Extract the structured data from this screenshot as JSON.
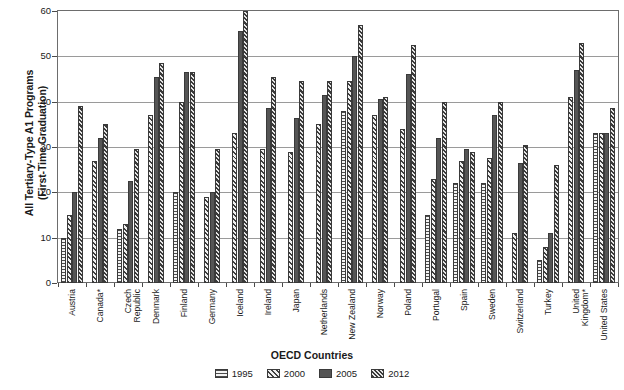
{
  "chart_data": {
    "type": "bar",
    "title": "",
    "xlabel": "OECD Countries",
    "ylabel": "All Tertiary-Type A1 Programs\n(First-Time Graduation)",
    "ylim": [
      0,
      60
    ],
    "yticks": [
      0,
      10,
      20,
      30,
      40,
      50,
      60
    ],
    "grid": true,
    "legend_position": "bottom",
    "categories": [
      "Austria",
      "Canada*",
      "Czech\nRepublic",
      "Denmark",
      "Finland",
      "Germany",
      "Iceland",
      "Ireland",
      "Japan",
      "Netherlands",
      "New Zealand",
      "Norway",
      "Poland",
      "Portugal",
      "Spain",
      "Sweden",
      "Switzerland",
      "Turkey",
      "United\nKingdom*",
      "United States"
    ],
    "series": [
      {
        "name": "1995",
        "pattern": "horizontal-lines",
        "values": [
          10,
          null,
          12,
          null,
          20,
          null,
          null,
          null,
          null,
          null,
          38,
          null,
          null,
          15,
          22,
          22,
          null,
          5,
          null,
          33
        ]
      },
      {
        "name": "2000",
        "pattern": "diagonal-hatch",
        "values": [
          15,
          27,
          13,
          37,
          40,
          19,
          33,
          29.5,
          29,
          35,
          44.5,
          37,
          34,
          23,
          27,
          27.5,
          11,
          8,
          41,
          33
        ]
      },
      {
        "name": "2005",
        "pattern": "solid-dark",
        "values": [
          20,
          32,
          22.5,
          45.5,
          46.5,
          20,
          55.5,
          38.5,
          36.5,
          41.5,
          50,
          40.5,
          46,
          32,
          29.5,
          37,
          26.5,
          11,
          47,
          33
        ]
      },
      {
        "name": "2012",
        "pattern": "dense-diagonal",
        "values": [
          39,
          35,
          29.5,
          48.5,
          46.5,
          29.5,
          60,
          45.5,
          44.5,
          44.5,
          57,
          41,
          52.5,
          40,
          29,
          40,
          30.5,
          26,
          53,
          38.5
        ]
      }
    ]
  },
  "legend": {
    "items": [
      {
        "label": "1995"
      },
      {
        "label": "2000"
      },
      {
        "label": "2005"
      },
      {
        "label": "2012"
      }
    ]
  }
}
